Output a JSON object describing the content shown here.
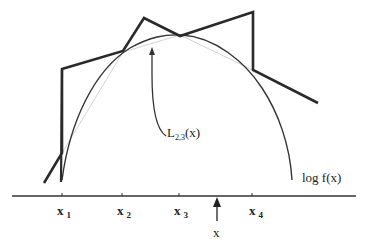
{
  "diagram": {
    "labels": {
      "curve": "log f(x)",
      "lower_hull_main": "L",
      "lower_hull_sub": "2,3",
      "lower_hull_arg": "(x)",
      "point": "x"
    },
    "abscissae": [
      {
        "main": "x",
        "sub": "1"
      },
      {
        "main": "x",
        "sub": "2"
      },
      {
        "main": "x",
        "sub": "3"
      },
      {
        "main": "x",
        "sub": "4"
      }
    ],
    "colors": {
      "curve": "#333333",
      "hull": "#2a2a2a",
      "chord": "#d0d0d0",
      "axis": "#333333"
    }
  }
}
